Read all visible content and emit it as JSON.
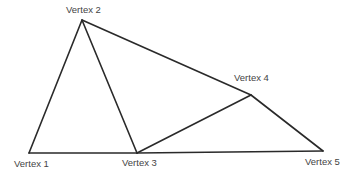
{
  "diagram": {
    "type": "graph",
    "line_color": "#2a2a2a",
    "label_color": "#444444",
    "vertices": [
      {
        "id": "v1",
        "label": "Vertex 1",
        "x": 29,
        "y": 153,
        "lx": 14,
        "ly": 167
      },
      {
        "id": "v2",
        "label": "Vertex 2",
        "x": 82,
        "y": 20,
        "lx": 66,
        "ly": 13
      },
      {
        "id": "v3",
        "label": "Vertex 3",
        "x": 137,
        "y": 153,
        "lx": 122,
        "ly": 166
      },
      {
        "id": "v4",
        "label": "Vertex 4",
        "x": 251,
        "y": 95,
        "lx": 234,
        "ly": 81
      },
      {
        "id": "v5",
        "label": "Vertex 5",
        "x": 323,
        "y": 151,
        "lx": 305,
        "ly": 165
      }
    ],
    "edges": [
      {
        "from": "v1",
        "to": "v2"
      },
      {
        "from": "v2",
        "to": "v3"
      },
      {
        "from": "v2",
        "to": "v4"
      },
      {
        "from": "v1",
        "to": "v3"
      },
      {
        "from": "v3",
        "to": "v5"
      },
      {
        "from": "v3",
        "to": "v4"
      },
      {
        "from": "v4",
        "to": "v5"
      }
    ]
  }
}
